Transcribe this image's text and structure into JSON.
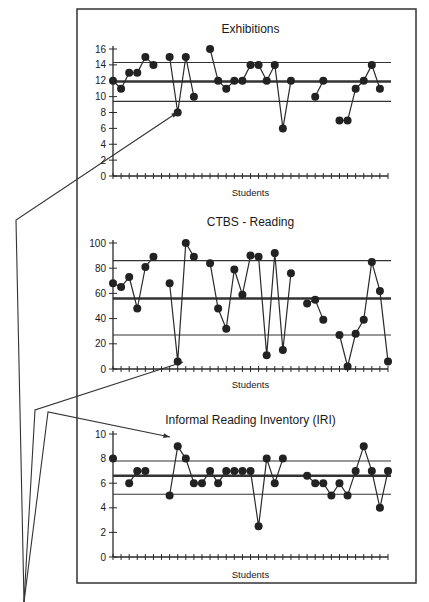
{
  "figure": {
    "frame_color": "#333333",
    "line_color": "#2a2a2a",
    "point_color": "#222222",
    "pointer_lines": {
      "origin": [
        24,
        602
      ],
      "targets": [
        [
          178,
          112
        ],
        [
          183,
          362
        ],
        [
          170,
          437
        ]
      ]
    }
  },
  "chart_data": [
    {
      "type": "line",
      "title": "Exhibitions",
      "xlabel": "Students",
      "ylabel": "",
      "ylim": [
        0,
        16
      ],
      "yticks": [
        0,
        2,
        4,
        6,
        8,
        10,
        12,
        14,
        16
      ],
      "x_count": 35,
      "grid": false,
      "control_lines": {
        "mean": 11.9,
        "ucl": 14.3,
        "lcl": 9.4
      },
      "values": [
        12,
        11,
        13,
        13,
        15,
        14,
        null,
        15,
        8,
        15,
        10,
        null,
        16,
        12,
        11,
        12,
        12,
        14,
        14,
        12,
        14,
        6,
        12,
        null,
        null,
        10,
        12,
        null,
        7,
        7,
        11,
        12,
        14,
        11,
        null
      ],
      "annotation": "arrow pointing to low value 8"
    },
    {
      "type": "line",
      "title": "CTBS - Reading",
      "xlabel": "Students",
      "ylabel": "",
      "ylim": [
        0,
        100
      ],
      "yticks": [
        0,
        20,
        40,
        60,
        80,
        100
      ],
      "x_count": 35,
      "grid": false,
      "control_lines": {
        "mean": 56,
        "ucl": 86,
        "lcl": 27
      },
      "values": [
        68,
        65,
        73,
        48,
        81,
        89,
        null,
        68,
        6,
        100,
        89,
        null,
        84,
        48,
        32,
        79,
        59,
        90,
        89,
        11,
        92,
        15,
        76,
        null,
        52,
        55,
        39,
        null,
        27,
        2,
        28,
        39,
        85,
        62,
        6
      ],
      "annotation": "arrow pointing to low value 6"
    },
    {
      "type": "line",
      "title": "Informal Reading Inventory (IRI)",
      "xlabel": "Students",
      "ylabel": "",
      "ylim": [
        0,
        10
      ],
      "yticks": [
        0,
        2,
        4,
        6,
        8,
        10
      ],
      "x_count": 35,
      "grid": false,
      "control_lines": {
        "mean": 6.6,
        "ucl": 7.8,
        "lcl": 5.1
      },
      "values": [
        8,
        null,
        6,
        7,
        7,
        null,
        null,
        5,
        9,
        8,
        6,
        6,
        7,
        6,
        7,
        7,
        7,
        7,
        2.5,
        8,
        6,
        8,
        null,
        null,
        6.6,
        6,
        6,
        5,
        6,
        5,
        7,
        9,
        7,
        4,
        7
      ],
      "annotation": "arrow pointing to high value 9"
    }
  ],
  "layout": {
    "frame": {
      "x": 77,
      "y": 9,
      "w": 339,
      "h": 574
    },
    "panels": [
      {
        "title_y": 33,
        "plot_top": 49,
        "plot_bottom": 176,
        "x_start": 113,
        "x_end": 388,
        "xlabel_y": 196
      },
      {
        "title_y": 226,
        "plot_top": 243,
        "plot_bottom": 369,
        "x_start": 113,
        "x_end": 388,
        "xlabel_y": 388
      },
      {
        "title_y": 424,
        "plot_top": 434,
        "plot_bottom": 557,
        "x_start": 113,
        "x_end": 388,
        "xlabel_y": 578
      }
    ]
  }
}
